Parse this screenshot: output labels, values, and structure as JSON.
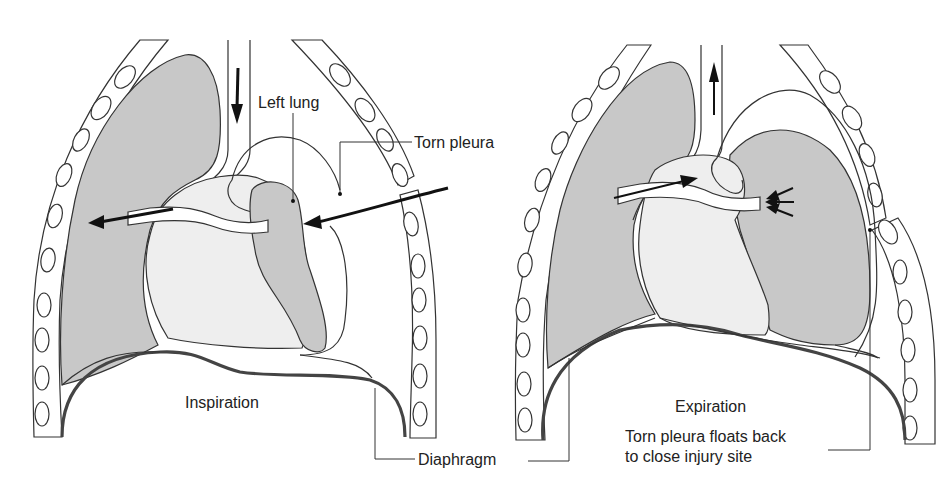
{
  "figure": {
    "panels": [
      {
        "id": "inspiration",
        "label": "Inspiration"
      },
      {
        "id": "expiration",
        "label": "Expiration"
      }
    ],
    "labels": {
      "left_lung": "Left lung",
      "torn_pleura": "Torn pleura",
      "diaphragm": "Diaphragm",
      "torn_pleura_note_line1": "Torn pleura floats back",
      "torn_pleura_note_line2": "to close injury site"
    },
    "colors": {
      "lung_fill": "#c8c8c8",
      "heart_fill": "#eeeeee",
      "line": "#333333",
      "diaphragm": "#444444",
      "background": "#ffffff"
    },
    "arrows": {
      "inspiration": [
        "trachea-air-down",
        "mediastinal-shift-left",
        "air-entering-chest-wall"
      ],
      "expiration": [
        "trachea-air-up",
        "mediastinal-shift-right",
        "lung-recoil-pressure"
      ]
    }
  }
}
